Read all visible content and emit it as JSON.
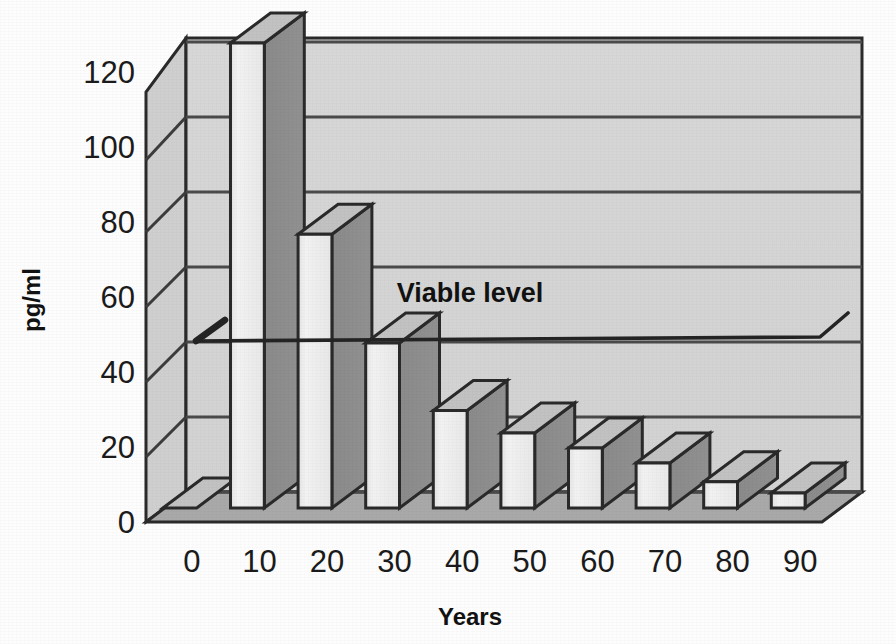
{
  "chart_data": {
    "type": "bar",
    "title": "",
    "subtitle": "",
    "xlabel": "Years",
    "ylabel": "pg/ml",
    "categories": [
      "0",
      "10",
      "20",
      "30",
      "40",
      "50",
      "60",
      "70",
      "80",
      "90"
    ],
    "values": [
      0,
      124,
      73,
      44,
      26,
      20,
      16,
      12,
      7,
      4
    ],
    "series": [
      {
        "name": "pg/ml",
        "values": [
          0,
          124,
          73,
          44,
          26,
          20,
          16,
          12,
          7,
          4
        ]
      }
    ],
    "ylim": [
      0,
      130
    ],
    "xlim": [
      0,
      10
    ],
    "y_ticks": [
      0,
      20,
      40,
      60,
      80,
      100,
      120
    ],
    "y_tick_labels": [
      "0",
      "20",
      "40",
      "60",
      "80",
      "100",
      "120"
    ],
    "x_tick_labels": [
      "0",
      "10",
      "20",
      "30",
      "40",
      "50",
      "60",
      "70",
      "80",
      "90"
    ],
    "grid": true,
    "grid_axis": "y",
    "legend": false,
    "legend_position": "none",
    "projection": "3d",
    "annotations": [
      {
        "text": "Viable level",
        "kind": "threshold-line-with-arrow",
        "y_value": 60,
        "arrow_direction": "left"
      }
    ]
  },
  "axes": {
    "y_title": "pg/ml",
    "x_title": "Years"
  },
  "annotation": {
    "viable_level_label": "Viable level"
  },
  "colors": {
    "plot_background": "#d5d5d5",
    "floor": "#a9a9a9",
    "bar_front": "#eeeeee",
    "bar_side": "#8b8b8b",
    "bar_top": "#c2c2c2",
    "gridline": "#4a4a4a",
    "outline": "#2a2a2a",
    "text": "#1b1b1b",
    "page_background": "#fdfdfd"
  }
}
